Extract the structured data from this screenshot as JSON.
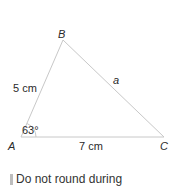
{
  "diagram": {
    "vertices": [
      {
        "name": "A",
        "x": 21,
        "y": 137
      },
      {
        "name": "B",
        "x": 63,
        "y": 40
      },
      {
        "name": "C",
        "x": 164,
        "y": 137
      }
    ],
    "labels": {
      "vertex_a": "A",
      "vertex_b": "B",
      "vertex_c": "C",
      "side_ab": "5 cm",
      "side_ac": "7 cm",
      "side_bc": "a",
      "angle_a": "63°"
    },
    "colors": {
      "line": "#c8c8c8",
      "text": "#2a2a2a"
    }
  },
  "note": {
    "text": "Do not round during"
  }
}
